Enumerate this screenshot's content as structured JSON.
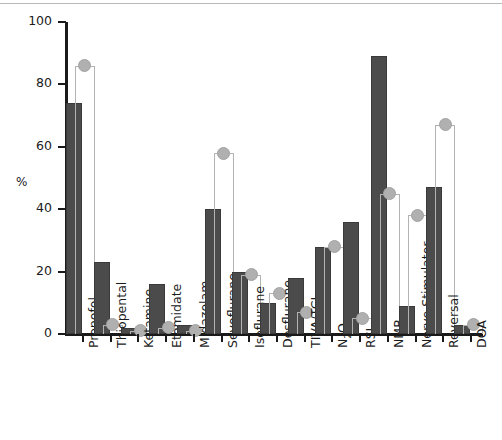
{
  "chart_data": {
    "type": "bar",
    "title": "",
    "subtitle": "",
    "xlabel": "",
    "ylabel": "%",
    "ylim": [
      0,
      100
    ],
    "yticks": [
      0,
      20,
      40,
      60,
      80,
      100
    ],
    "ytick_labels": [
      "0",
      "20",
      "40",
      "60",
      "80",
      "100"
    ],
    "grid": false,
    "legend": "none",
    "categories": [
      "Propofol",
      "Thiopental",
      "Ketamine",
      "Etomidate",
      "Midazolam",
      "Sevoflurane",
      "Isoflurane",
      "Desflurane",
      "TIVA/TCI",
      "N2O",
      "RSI",
      "NMB",
      "Nerve Stimulator",
      "Reversal",
      "DOA"
    ],
    "category_labels_html": [
      "Propofol",
      "Thiopental",
      "Ketamine",
      "Etomidate",
      "Midazolam",
      "Sevoflurane",
      "Isoflurane",
      "Desflurane",
      "TIVA/TCI",
      "N<sub>2</sub>O",
      "RSI",
      "NMB",
      "Nerve Stimulator",
      "Reversal",
      "DOA"
    ],
    "series": [
      {
        "name": "filled-bar",
        "style": "solid-dark-bar",
        "color": "#4b4b4b",
        "values": [
          74,
          23,
          2,
          16,
          3,
          40,
          20,
          10,
          18,
          28,
          36,
          89,
          9,
          47,
          3
        ]
      },
      {
        "name": "outlined-bar-with-marker",
        "style": "open-bar-gray-outline-with-circle-marker",
        "color": "#b3b3b3",
        "marker_color": "#b0b0b0",
        "values": [
          86,
          3,
          1,
          2,
          1,
          58,
          19,
          13,
          7,
          28,
          5,
          45,
          38,
          67,
          3
        ]
      }
    ]
  },
  "axis": {
    "y_unit_label": "%"
  }
}
